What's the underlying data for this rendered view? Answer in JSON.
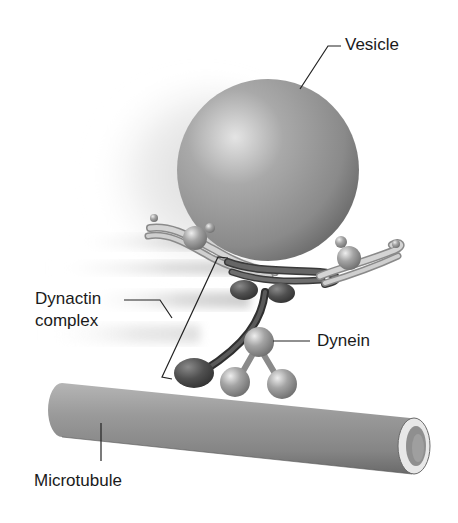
{
  "diagram": {
    "labels": {
      "vesicle": "Vesicle",
      "dynactin_line1": "Dynactin",
      "dynactin_line2": "complex",
      "dynein": "Dynein",
      "microtubule": "Microtubule"
    },
    "colors": {
      "background": "#ffffff",
      "vesicle_light": "#d8d8d8",
      "vesicle_mid": "#9a9a9a",
      "vesicle_dark": "#6a6a6a",
      "strand_light": "#cfcfcf",
      "strand_dark": "#555555",
      "dynein_ball": "#a8a8a8",
      "dynactin_arm": "#4a4a4a",
      "microtubule_body": "#8e8e8e",
      "microtubule_end_rim": "#e6e6e6",
      "leader_line": "#222222",
      "text": "#1a1a1a"
    }
  }
}
